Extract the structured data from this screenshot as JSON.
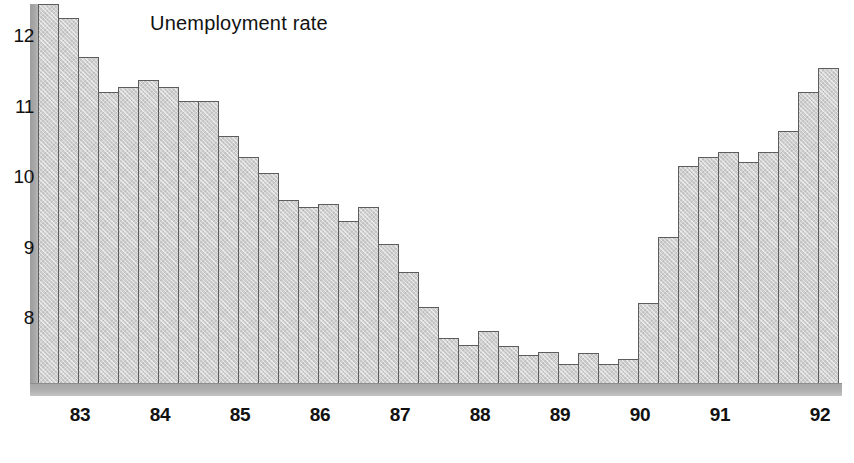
{
  "chart_data": {
    "type": "bar",
    "title": "Unemployment rate",
    "xlabel": "",
    "ylabel": "",
    "ylim": [
      7.2,
      12.55
    ],
    "yticks": [
      8,
      9,
      10,
      11,
      12
    ],
    "ytick_labels": [
      "8",
      "9",
      "10",
      "11",
      "12"
    ],
    "xtick_labels": [
      "83",
      "84",
      "85",
      "86",
      "87",
      "88",
      "89",
      "90",
      "91",
      "92"
    ],
    "grid": false,
    "legend": null,
    "units": "percent",
    "frequency": "quarterly",
    "categories": [
      "82Q4",
      "83Q1",
      "83Q2",
      "83Q3",
      "84Q1",
      "84Q2",
      "84Q3",
      "84Q4",
      "85Q1",
      "85Q2",
      "85Q3",
      "85Q4",
      "86Q1",
      "86Q2",
      "86Q3",
      "86Q4",
      "87Q1",
      "87Q2",
      "87Q3",
      "87Q4",
      "88Q1",
      "88Q2",
      "88Q3",
      "88Q4",
      "89Q1",
      "89Q2",
      "89Q3",
      "89Q4",
      "90Q1",
      "90Q2",
      "90Q3",
      "90Q4",
      "91Q1",
      "91Q2",
      "91Q3",
      "91Q4",
      "92Q1",
      "92Q2",
      "92Q3",
      "92Q4"
    ],
    "values": [
      12.45,
      12.25,
      11.7,
      11.2,
      11.28,
      11.38,
      11.28,
      11.08,
      11.08,
      10.58,
      10.28,
      10.05,
      9.68,
      9.58,
      9.62,
      9.38,
      9.58,
      9.05,
      8.65,
      8.15,
      7.72,
      7.62,
      7.82,
      7.6,
      7.48,
      7.52,
      7.35,
      7.5,
      7.35,
      7.42,
      8.22,
      9.15,
      10.15,
      10.28,
      10.35,
      10.22,
      10.35,
      10.65,
      11.2,
      11.55
    ],
    "colors": {
      "bar_fill": "#cfcfcf",
      "bar_stroke": "#5d5d5d",
      "axis": "#a8a8a8",
      "text": "#111111",
      "background": "#ffffff"
    }
  },
  "axis": {
    "y_tick_positions_px": [
      318,
      248,
      177,
      107,
      36
    ],
    "x_tick_positions_px": [
      80,
      160,
      240,
      320,
      400,
      480,
      560,
      640,
      720,
      820
    ]
  }
}
